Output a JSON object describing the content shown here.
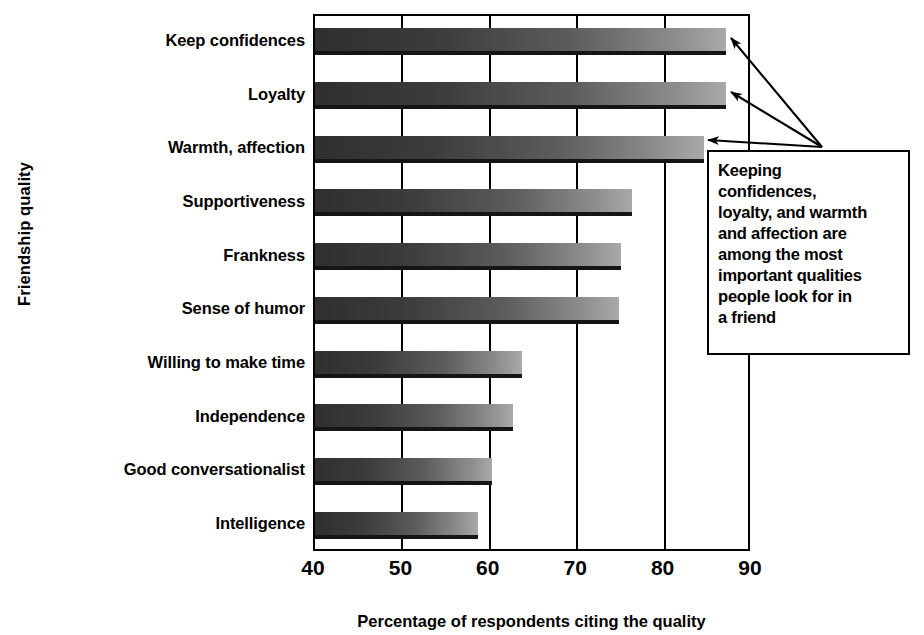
{
  "chart_data": {
    "type": "bar",
    "orientation": "horizontal",
    "title": "",
    "xlabel": "Percentage of respondents citing the quality",
    "ylabel": "Friendship quality",
    "xlim": [
      40,
      90
    ],
    "xticks": [
      40,
      50,
      60,
      70,
      80,
      90
    ],
    "grid": true,
    "legend": null,
    "categories": [
      "Keep confidences",
      "Loyalty",
      "Warmth, affection",
      "Supportiveness",
      "Frankness",
      "Sense of humor",
      "Willing to make time",
      "Independence",
      "Good conversationalist",
      "Intelligence"
    ],
    "values": [
      87,
      87,
      84.5,
      76.3,
      75,
      74.8,
      63.7,
      62.6,
      60.3,
      58.6
    ],
    "annotations": [
      {
        "text": "Keeping confidences, loyalty, and warmth and affection are among the most important qualities people look for in a friend",
        "points_to": [
          "Keep confidences",
          "Loyalty",
          "Warmth, affection"
        ]
      }
    ],
    "colors": {
      "bar_gradient_start": "#2f2f2f",
      "bar_gradient_end": "#a9a9a9",
      "bar_shadow": "#151515",
      "axis": "#000000",
      "background": "#ffffff"
    }
  },
  "callout": {
    "lines": [
      "Keeping",
      "confidences,",
      "loyalty, and warmth",
      "and affection are",
      "among the most",
      "important qualities",
      "people look for in",
      "a friend"
    ]
  }
}
